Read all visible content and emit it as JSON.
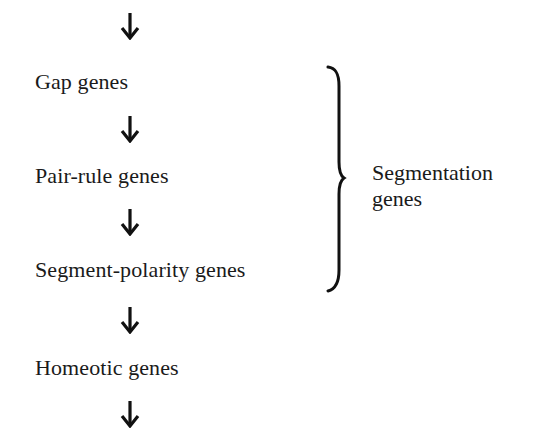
{
  "diagram": {
    "type": "flowchart",
    "direction": "top-to-bottom",
    "steps": [
      {
        "label": "Gap genes"
      },
      {
        "label": "Pair-rule genes"
      },
      {
        "label": "Segment-polarity genes"
      },
      {
        "label": "Homeotic genes"
      }
    ],
    "group": {
      "bracket_spans": [
        "Gap genes",
        "Pair-rule genes",
        "Segment-polarity genes"
      ],
      "label_line1": "Segmentation",
      "label_line2": "genes"
    },
    "arrow_icon": "down-arrow-icon",
    "colors": {
      "text": "#1a1a1a",
      "background": "#ffffff"
    }
  }
}
